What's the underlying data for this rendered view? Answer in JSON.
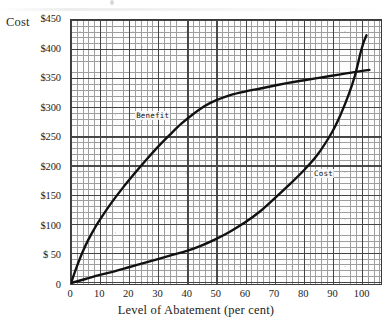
{
  "chart_data": {
    "type": "line",
    "title": "",
    "xlabel": "Level of Abatement (per cent)",
    "ylabel": "Cost",
    "xlim": [
      0,
      107
    ],
    "ylim": [
      0,
      450
    ],
    "grid": true,
    "legend_position": "inline-curve-labels",
    "xticks": [
      "0",
      "10",
      "20",
      "30",
      "40",
      "50",
      "60",
      "70",
      "80",
      "90",
      "100"
    ],
    "xtick_values": [
      0,
      10,
      20,
      30,
      40,
      50,
      60,
      70,
      80,
      90,
      100
    ],
    "yticks": [
      "0",
      "$ 50",
      "$100",
      "$150",
      "$200",
      "$250",
      "$300",
      "$350",
      "$400",
      "$450"
    ],
    "ytick_values": [
      0,
      50,
      100,
      150,
      200,
      250,
      300,
      350,
      400,
      450
    ],
    "series": [
      {
        "name": "Benefit",
        "label": "Benefit",
        "color": "#111111",
        "x": [
          0,
          2,
          4,
          6,
          8,
          10,
          14,
          18,
          22,
          26,
          30,
          34,
          38,
          42,
          46,
          50,
          55,
          60,
          65,
          70,
          75,
          80,
          85,
          90,
          95,
          100,
          103
        ],
        "y": [
          2,
          30,
          55,
          76,
          94,
          110,
          139,
          165,
          189,
          212,
          234,
          254,
          273,
          289,
          303,
          313,
          322,
          328,
          333,
          338,
          343,
          347,
          351,
          355,
          359,
          363,
          365
        ]
      },
      {
        "name": "Cost",
        "label": "Cost",
        "color": "#111111",
        "x": [
          0,
          5,
          10,
          15,
          20,
          25,
          30,
          35,
          40,
          45,
          50,
          55,
          60,
          65,
          70,
          75,
          80,
          85,
          90,
          93,
          96,
          98,
          100,
          101,
          102
        ],
        "y": [
          2,
          9,
          16,
          22,
          29,
          36,
          43,
          50,
          57,
          66,
          77,
          90,
          105,
          123,
          145,
          168,
          192,
          220,
          258,
          288,
          325,
          355,
          395,
          412,
          424
        ]
      }
    ],
    "annotations": [
      {
        "text": "Benefit",
        "x": 22,
        "y": 288
      },
      {
        "text": "Cost",
        "x": 83,
        "y": 190
      }
    ]
  }
}
